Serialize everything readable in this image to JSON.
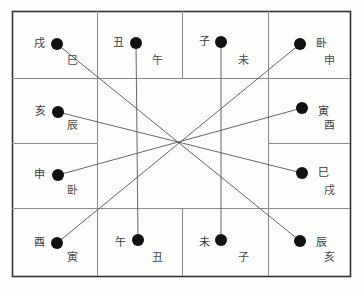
{
  "chart_data": {
    "type": "diagram",
    "title": "",
    "grid": {
      "outer_border": {
        "x": 12,
        "y": 11,
        "width": 338,
        "height": 265,
        "color": "#333333"
      },
      "line_color": "#8a8a8a",
      "vertical_lines": [
        {
          "name": "v-left",
          "x": 97,
          "y1": 11,
          "y2": 276
        },
        {
          "name": "v-mid-top",
          "x": 182,
          "y1": 11,
          "y2": 78
        },
        {
          "name": "v-mid-bottom",
          "x": 182,
          "y1": 208,
          "y2": 276
        },
        {
          "name": "v-right",
          "x": 268,
          "y1": 11,
          "y2": 276
        }
      ],
      "horizontal_lines": [
        {
          "name": "h-row1",
          "x1": 12,
          "x2": 350,
          "y": 78
        },
        {
          "name": "h-row2-left",
          "x1": 12,
          "x2": 97,
          "y": 143
        },
        {
          "name": "h-row2-right",
          "x1": 268,
          "x2": 350,
          "y": 143
        },
        {
          "name": "h-row3",
          "x1": 12,
          "x2": 350,
          "y": 208
        }
      ]
    },
    "cell_labels": [
      {
        "name": "cell-label-si",
        "text": "巳",
        "x": 78,
        "y": 66
      },
      {
        "name": "cell-label-wu",
        "text": "午",
        "x": 163,
        "y": 66
      },
      {
        "name": "cell-label-wei",
        "text": "未",
        "x": 249,
        "y": 66
      },
      {
        "name": "cell-label-shen",
        "text": "申",
        "x": 335,
        "y": 66
      },
      {
        "name": "cell-label-chen",
        "text": "辰",
        "x": 78,
        "y": 131
      },
      {
        "name": "cell-label-you",
        "text": "酉",
        "x": 335,
        "y": 131
      },
      {
        "name": "cell-label-mao",
        "text": "卧",
        "x": 78,
        "y": 196
      },
      {
        "name": "cell-label-xu",
        "text": "戌",
        "x": 335,
        "y": 196
      },
      {
        "name": "cell-label-yin",
        "text": "寅",
        "x": 78,
        "y": 263
      },
      {
        "name": "cell-label-chou",
        "text": "丑",
        "x": 163,
        "y": 263
      },
      {
        "name": "cell-label-zi",
        "text": "子",
        "x": 249,
        "y": 263
      },
      {
        "name": "cell-label-hai",
        "text": "亥",
        "x": 335,
        "y": 263
      }
    ],
    "nodes": [
      {
        "name": "node-xu",
        "label": "戌",
        "dot_x": 57,
        "dot_y": 44,
        "label_x": 34,
        "label_y": 44,
        "label_side": "left"
      },
      {
        "name": "node-chou",
        "label": "丑",
        "dot_x": 136,
        "dot_y": 43,
        "label_x": 113,
        "label_y": 43,
        "label_side": "left"
      },
      {
        "name": "node-zi",
        "label": "子",
        "dot_x": 221,
        "dot_y": 42,
        "label_x": 199,
        "label_y": 42,
        "label_side": "left"
      },
      {
        "name": "node-mao",
        "label": "卧",
        "dot_x": 300,
        "dot_y": 44,
        "label_x": 316,
        "label_y": 44,
        "label_side": "right"
      },
      {
        "name": "node-hai",
        "label": "亥",
        "dot_x": 58,
        "dot_y": 112,
        "label_x": 35,
        "label_y": 112,
        "label_side": "left"
      },
      {
        "name": "node-yin",
        "label": "寅",
        "dot_x": 302,
        "dot_y": 108,
        "label_x": 318,
        "label_y": 112,
        "label_side": "right"
      },
      {
        "name": "node-shen",
        "label": "申",
        "dot_x": 58,
        "dot_y": 175,
        "label_x": 34,
        "label_y": 175,
        "label_side": "left"
      },
      {
        "name": "node-si",
        "label": "巳",
        "dot_x": 302,
        "dot_y": 173,
        "label_x": 318,
        "label_y": 173,
        "label_side": "right"
      },
      {
        "name": "node-you",
        "label": "酉",
        "dot_x": 57,
        "dot_y": 243,
        "label_x": 34,
        "label_y": 243,
        "label_side": "left"
      },
      {
        "name": "node-wu",
        "label": "午",
        "dot_x": 138,
        "dot_y": 240,
        "label_x": 115,
        "label_y": 243,
        "label_side": "left"
      },
      {
        "name": "node-wei",
        "label": "未",
        "dot_x": 221,
        "dot_y": 240,
        "label_x": 199,
        "label_y": 243,
        "label_side": "left"
      },
      {
        "name": "node-chen",
        "label": "辰",
        "dot_x": 300,
        "dot_y": 241,
        "label_x": 316,
        "label_y": 243,
        "label_side": "right"
      }
    ],
    "connectors": [
      {
        "name": "connector-xu-chen",
        "from": "node-xu",
        "to": "node-chen"
      },
      {
        "name": "connector-chou-wu",
        "from": "node-chou",
        "to": "node-wu"
      },
      {
        "name": "connector-zi-wei",
        "from": "node-zi",
        "to": "node-wei"
      },
      {
        "name": "connector-mao-you",
        "from": "node-mao",
        "to": "node-you"
      },
      {
        "name": "connector-hai-si",
        "from": "node-hai",
        "to": "node-si"
      },
      {
        "name": "connector-shen-yin",
        "from": "node-shen",
        "to": "node-yin"
      }
    ],
    "dot_radius": 6,
    "dot_color": "#111111",
    "connector_color": "#555555",
    "connector_width": 0.9
  }
}
